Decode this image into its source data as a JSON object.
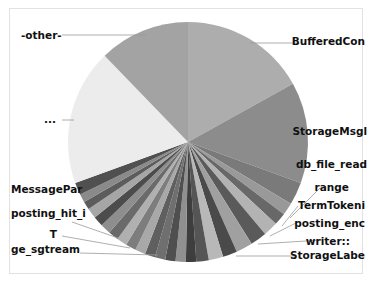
{
  "chart_data": {
    "type": "pie",
    "title": "",
    "center": [
      188,
      142
    ],
    "radius": 120,
    "start_angle_deg": 0,
    "direction": "clockwise",
    "slices": [
      {
        "label": "BufferedCon",
        "start": 0,
        "end": 61,
        "color": "#adadad",
        "show_label": true,
        "label_x": 365,
        "label_y": 45,
        "anchor": "end",
        "leader": [
          [
            250,
            43
          ],
          [
            298,
            43
          ]
        ]
      },
      {
        "label": "StorageMsgl",
        "start": 61,
        "end": 110,
        "color": "#8c8c8c",
        "show_label": true,
        "label_x": 367,
        "label_y": 135,
        "anchor": "end",
        "leader": []
      },
      {
        "label": "db_file_read",
        "start": 110,
        "end": 121,
        "color": "#7a7a7a",
        "show_label": true,
        "label_x": 367,
        "label_y": 168,
        "anchor": "end",
        "leader": []
      },
      {
        "label": "range",
        "start": 121,
        "end": 127,
        "color": "#999999",
        "show_label": true,
        "label_x": 349,
        "label_y": 191,
        "anchor": "end",
        "leader": [
          [
            290,
            218
          ],
          [
            320,
            188
          ]
        ]
      },
      {
        "label": "TermTokeni",
        "start": 127,
        "end": 133,
        "color": "#686868",
        "show_label": true,
        "label_x": 365,
        "label_y": 209,
        "anchor": "end",
        "leader": [
          [
            282,
            226
          ],
          [
            298,
            206
          ]
        ]
      },
      {
        "label": "posting_enc",
        "start": 133,
        "end": 140,
        "color": "#b3b3b3",
        "show_label": true,
        "label_x": 365,
        "label_y": 227,
        "anchor": "end",
        "leader": [
          [
            270,
            236
          ],
          [
            296,
            223
          ]
        ]
      },
      {
        "label": "writer::",
        "start": 140,
        "end": 148,
        "color": "#5a5a5a",
        "show_label": true,
        "label_x": 350,
        "label_y": 245,
        "anchor": "end",
        "leader": [
          [
            258,
            244
          ],
          [
            322,
            240
          ]
        ]
      },
      {
        "label": "StorageLabe",
        "start": 148,
        "end": 156,
        "color": "#a0a0a0",
        "show_label": true,
        "label_x": 365,
        "label_y": 259,
        "anchor": "end",
        "leader": [
          [
            236,
            256
          ],
          [
            296,
            256
          ]
        ]
      },
      {
        "label": "",
        "start": 156,
        "end": 163,
        "color": "#4a4a4a",
        "show_label": false
      },
      {
        "label": "",
        "start": 163,
        "end": 170,
        "color": "#b8b8b8",
        "show_label": false
      },
      {
        "label": "",
        "start": 170,
        "end": 176,
        "color": "#555555",
        "show_label": false
      },
      {
        "label": "",
        "start": 176,
        "end": 181,
        "color": "#3e3e3e",
        "show_label": false
      },
      {
        "label": "",
        "start": 181,
        "end": 186,
        "color": "#909090",
        "show_label": false
      },
      {
        "label": "",
        "start": 186,
        "end": 191,
        "color": "#4f4f4f",
        "show_label": false
      },
      {
        "label": "ge_sgtream",
        "start": 191,
        "end": 196,
        "color": "#6f6f6f",
        "show_label": true,
        "label_x": 11,
        "label_y": 253,
        "anchor": "start",
        "leader": [
          [
            80,
            253
          ],
          [
            158,
            255
          ]
        ]
      },
      {
        "label": "",
        "start": 196,
        "end": 201,
        "color": "#5f5f5f",
        "show_label": false
      },
      {
        "label": "T",
        "start": 201,
        "end": 206,
        "color": "#a8a8a8",
        "show_label": true,
        "label_x": 57,
        "label_y": 238,
        "anchor": "end",
        "leader": [
          [
            62,
            236
          ],
          [
            130,
            248
          ]
        ]
      },
      {
        "label": "",
        "start": 206,
        "end": 211,
        "color": "#7d7d7d",
        "show_label": false
      },
      {
        "label": "",
        "start": 211,
        "end": 216,
        "color": "#b0b0b0",
        "show_label": false
      },
      {
        "label": "posting_hit_i",
        "start": 216,
        "end": 221,
        "color": "#6a6a6a",
        "show_label": true,
        "label_x": 11,
        "label_y": 217,
        "anchor": "start",
        "leader": [
          [
            72,
            222
          ],
          [
            118,
            238
          ]
        ]
      },
      {
        "label": "",
        "start": 221,
        "end": 226,
        "color": "#8e8e8e",
        "show_label": false
      },
      {
        "label": "",
        "start": 226,
        "end": 231,
        "color": "#4c4c4c",
        "show_label": false
      },
      {
        "label": "",
        "start": 231,
        "end": 236,
        "color": "#a6a6a6",
        "show_label": false
      },
      {
        "label": "",
        "start": 236,
        "end": 240,
        "color": "#5c5c5c",
        "show_label": false
      },
      {
        "label": "",
        "start": 240,
        "end": 244,
        "color": "#8a8a8a",
        "show_label": false
      },
      {
        "label": "MessagePar",
        "start": 244,
        "end": 250,
        "color": "#505050",
        "show_label": true,
        "label_x": 11,
        "label_y": 193,
        "anchor": "start",
        "leader": []
      },
      {
        "label": "...",
        "start": 250,
        "end": 316,
        "color": "#ececec",
        "show_label": true,
        "label_x": 44,
        "label_y": 123,
        "anchor": "start",
        "leader": [
          [
            62,
            120
          ],
          [
            74,
            120
          ]
        ]
      },
      {
        "label": "-other-",
        "start": 316,
        "end": 360,
        "color": "#a3a3a3",
        "show_label": true,
        "label_x": 21,
        "label_y": 39,
        "anchor": "start",
        "leader": [
          [
            62,
            35
          ],
          [
            146,
            35
          ]
        ]
      }
    ],
    "legend": "none",
    "frame": true
  }
}
